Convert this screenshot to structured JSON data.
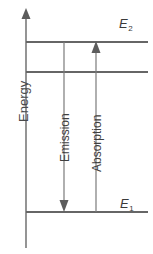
{
  "figure": {
    "type": "energy-level-diagram",
    "title": "",
    "axis": {
      "label": "Energy",
      "direction": "up",
      "arrow": true
    },
    "levels": [
      {
        "name": "E2",
        "label": "E",
        "subscript": "2",
        "role": "excited-state",
        "y": 42
      },
      {
        "name": "intermediate",
        "label": "",
        "subscript": "",
        "role": "intermediate-line",
        "y": 72
      },
      {
        "name": "E1",
        "label": "E",
        "subscript": "1",
        "role": "ground-state",
        "y": 212
      }
    ],
    "transitions": [
      {
        "name": "emission",
        "label": "Emission",
        "direction": "down",
        "from": "E2",
        "to": "E1",
        "x": 64
      },
      {
        "name": "absorption",
        "label": "Absorption",
        "direction": "up",
        "from": "E1",
        "to": "E2",
        "x": 96
      }
    ],
    "colors": {
      "line": "#666666",
      "axis": "#7a7a7a",
      "arrow": "#6e6e6e",
      "text": "#3f3f3f",
      "background": "#ffffff"
    }
  }
}
